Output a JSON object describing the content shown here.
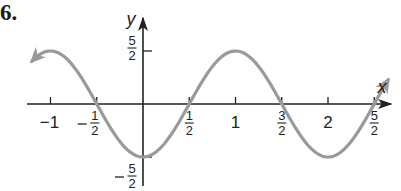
{
  "problem_number": "6.",
  "chart_data": {
    "type": "line",
    "title": "",
    "xlabel": "x",
    "ylabel": "y",
    "function": "y = -(5/2)·cos(πx)",
    "xlim": [
      -1.2,
      2.65
    ],
    "ylim": [
      -2.9,
      2.9
    ],
    "grid": false,
    "legend": null,
    "x_ticks": [
      {
        "value": -1,
        "label": "−1"
      },
      {
        "value": -0.5,
        "label": "−1/2",
        "neg": true,
        "num": "1",
        "den": "2"
      },
      {
        "value": 0.5,
        "label": "1/2",
        "num": "1",
        "den": "2"
      },
      {
        "value": 1,
        "label": "1"
      },
      {
        "value": 1.5,
        "label": "3/2",
        "num": "3",
        "den": "2"
      },
      {
        "value": 2,
        "label": "2"
      },
      {
        "value": 2.5,
        "label": "5/2",
        "num": "5",
        "den": "2"
      }
    ],
    "y_ticks": [
      {
        "value": 2.5,
        "label": "5/2",
        "num": "5",
        "den": "2"
      },
      {
        "value": -2.5,
        "label": "−5/2",
        "neg": true,
        "num": "5",
        "den": "2"
      }
    ],
    "series": [
      {
        "name": "curve",
        "color": "#9a9a9a",
        "x": [
          -1.2,
          -1,
          -0.5,
          0,
          0.5,
          1,
          1.5,
          2,
          2.5,
          2.65
        ],
        "y": [
          2.02,
          2.5,
          0,
          -2.5,
          0,
          2.5,
          0,
          -2.5,
          0,
          1.13
        ],
        "arrow_left": true,
        "arrow_right": true
      }
    ],
    "key_points": {
      "max": [
        1,
        2.5
      ],
      "min": [
        [
          0,
          -2.5
        ],
        [
          2,
          -2.5
        ]
      ],
      "zeros": [
        -0.5,
        0.5,
        1.5,
        2.5
      ]
    }
  }
}
